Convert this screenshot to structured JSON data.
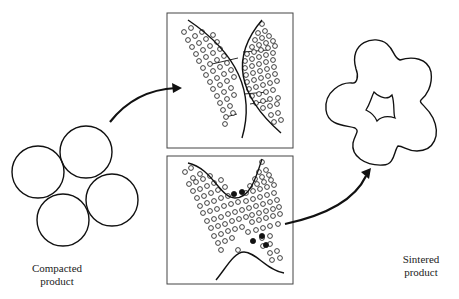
{
  "labels": {
    "compacted": "Compacted product",
    "sintered": "Sintered product"
  },
  "colors": {
    "stroke": "#111111",
    "box_border": "#444444",
    "background": "#ffffff"
  },
  "compacted_particles": [
    {
      "cx": 38,
      "cy": 172,
      "r": 26
    },
    {
      "cx": 86,
      "cy": 152,
      "r": 26
    },
    {
      "cx": 112,
      "cy": 200,
      "r": 26
    },
    {
      "cx": 63,
      "cy": 220,
      "r": 26
    }
  ],
  "panels": [
    {
      "name": "neck-formation-panel",
      "x": 167,
      "y": 13,
      "w": 126,
      "h": 135,
      "curves": [
        "M 188 20 Q 262 70 242 138",
        "M 262 20 Q 215 75 281 133"
      ],
      "open_dots": [
        [
          184,
          32
        ],
        [
          191,
          28
        ],
        [
          188,
          40
        ],
        [
          195,
          36
        ],
        [
          202,
          32
        ],
        [
          192,
          47
        ],
        [
          199,
          43
        ],
        [
          206,
          39
        ],
        [
          213,
          35
        ],
        [
          196,
          54
        ],
        [
          203,
          50
        ],
        [
          210,
          46
        ],
        [
          217,
          42
        ],
        [
          199,
          61
        ],
        [
          206,
          57
        ],
        [
          213,
          53
        ],
        [
          220,
          49
        ],
        [
          203,
          68
        ],
        [
          210,
          64
        ],
        [
          217,
          60
        ],
        [
          224,
          56
        ],
        [
          206,
          75
        ],
        [
          213,
          71
        ],
        [
          220,
          67
        ],
        [
          227,
          63
        ],
        [
          210,
          82
        ],
        [
          217,
          78
        ],
        [
          224,
          74
        ],
        [
          231,
          70
        ],
        [
          213,
          89
        ],
        [
          220,
          85
        ],
        [
          227,
          81
        ],
        [
          234,
          77
        ],
        [
          217,
          96
        ],
        [
          224,
          92
        ],
        [
          231,
          88
        ],
        [
          220,
          103
        ],
        [
          227,
          99
        ],
        [
          234,
          95
        ],
        [
          223,
          110
        ],
        [
          230,
          106
        ],
        [
          226,
          117
        ],
        [
          233,
          113
        ],
        [
          225,
          124
        ],
        [
          262,
          24
        ],
        [
          258,
          33
        ],
        [
          265,
          31
        ],
        [
          255,
          40
        ],
        [
          262,
          38
        ],
        [
          269,
          36
        ],
        [
          252,
          47
        ],
        [
          259,
          45
        ],
        [
          266,
          43
        ],
        [
          273,
          41
        ],
        [
          247,
          54
        ],
        [
          254,
          52
        ],
        [
          261,
          50
        ],
        [
          268,
          48
        ],
        [
          275,
          46
        ],
        [
          245,
          61
        ],
        [
          252,
          59
        ],
        [
          259,
          57
        ],
        [
          266,
          55
        ],
        [
          273,
          53
        ],
        [
          245,
          68
        ],
        [
          252,
          66
        ],
        [
          259,
          64
        ],
        [
          266,
          62
        ],
        [
          273,
          60
        ],
        [
          246,
          75
        ],
        [
          253,
          73
        ],
        [
          260,
          71
        ],
        [
          267,
          69
        ],
        [
          274,
          67
        ],
        [
          247,
          82
        ],
        [
          254,
          80
        ],
        [
          261,
          78
        ],
        [
          268,
          76
        ],
        [
          275,
          74
        ],
        [
          249,
          89
        ],
        [
          256,
          87
        ],
        [
          263,
          85
        ],
        [
          270,
          83
        ],
        [
          277,
          81
        ],
        [
          252,
          96
        ],
        [
          259,
          94
        ],
        [
          266,
          92
        ],
        [
          273,
          90
        ],
        [
          278,
          98
        ],
        [
          256,
          103
        ],
        [
          263,
          101
        ],
        [
          270,
          99
        ],
        [
          263,
          108
        ],
        [
          270,
          106
        ],
        [
          277,
          104
        ],
        [
          271,
          115
        ],
        [
          278,
          113
        ],
        [
          274,
          122
        ],
        [
          281,
          120
        ]
      ],
      "bonds": [
        [
          [
            243,
            52
          ],
          [
            268,
            50
          ]
        ],
        [
          [
            212,
            64
          ],
          [
            238,
            58
          ]
        ],
        [
          [
            244,
            94
          ],
          [
            268,
            92
          ]
        ],
        [
          [
            250,
            104
          ],
          [
            268,
            101
          ]
        ],
        [
          [
            226,
            117
          ],
          [
            237,
            114
          ]
        ]
      ],
      "filled_dots": []
    },
    {
      "name": "neck-growth-panel",
      "x": 167,
      "y": 156,
      "w": 126,
      "h": 128,
      "curves": [
        "M 188 163 C 212 168 220 198 235 198 C 250 198 256 178 262 159",
        "M 216 280 C 226 268 234 252 244 252 C 256 252 266 270 284 273"
      ],
      "open_dots": [
        [
          185,
          172
        ],
        [
          191,
          168
        ],
        [
          193,
          178
        ],
        [
          200,
          174
        ],
        [
          189,
          184
        ],
        [
          196,
          182
        ],
        [
          203,
          179
        ],
        [
          210,
          176
        ],
        [
          193,
          191
        ],
        [
          200,
          189
        ],
        [
          207,
          186
        ],
        [
          214,
          183
        ],
        [
          221,
          180
        ],
        [
          197,
          198
        ],
        [
          204,
          196
        ],
        [
          211,
          193
        ],
        [
          218,
          190
        ],
        [
          225,
          187
        ],
        [
          200,
          206
        ],
        [
          207,
          203
        ],
        [
          214,
          201
        ],
        [
          221,
          198
        ],
        [
          228,
          196
        ],
        [
          203,
          213
        ],
        [
          210,
          211
        ],
        [
          217,
          209
        ],
        [
          224,
          206
        ],
        [
          231,
          204
        ],
        [
          238,
          202
        ],
        [
          207,
          221
        ],
        [
          214,
          219
        ],
        [
          221,
          217
        ],
        [
          228,
          214
        ],
        [
          235,
          212
        ],
        [
          242,
          210
        ],
        [
          211,
          228
        ],
        [
          218,
          226
        ],
        [
          225,
          224
        ],
        [
          232,
          221
        ],
        [
          239,
          219
        ],
        [
          246,
          217
        ],
        [
          214,
          236
        ],
        [
          221,
          234
        ],
        [
          228,
          231
        ],
        [
          235,
          229
        ],
        [
          242,
          227
        ],
        [
          218,
          243
        ],
        [
          225,
          241
        ],
        [
          232,
          238
        ],
        [
          248,
          232
        ],
        [
          221,
          250
        ],
        [
          238,
          250
        ],
        [
          262,
          162
        ],
        [
          259,
          172
        ],
        [
          266,
          170
        ],
        [
          255,
          179
        ],
        [
          262,
          177
        ],
        [
          269,
          175
        ],
        [
          250,
          186
        ],
        [
          257,
          184
        ],
        [
          264,
          182
        ],
        [
          271,
          180
        ],
        [
          246,
          193
        ],
        [
          253,
          191
        ],
        [
          260,
          189
        ],
        [
          267,
          187
        ],
        [
          274,
          185
        ],
        [
          246,
          201
        ],
        [
          253,
          199
        ],
        [
          260,
          197
        ],
        [
          267,
          195
        ],
        [
          274,
          193
        ],
        [
          249,
          208
        ],
        [
          256,
          206
        ],
        [
          263,
          204
        ],
        [
          270,
          202
        ],
        [
          277,
          200
        ],
        [
          252,
          215
        ],
        [
          259,
          213
        ],
        [
          266,
          211
        ],
        [
          273,
          209
        ],
        [
          279,
          207
        ],
        [
          252,
          222
        ],
        [
          259,
          220
        ],
        [
          266,
          218
        ],
        [
          273,
          216
        ],
        [
          280,
          214
        ],
        [
          256,
          230
        ],
        [
          263,
          228
        ],
        [
          270,
          226
        ],
        [
          278,
          224
        ],
        [
          262,
          238
        ],
        [
          270,
          236
        ],
        [
          263,
          246
        ],
        [
          270,
          244
        ],
        [
          270,
          253
        ],
        [
          277,
          251
        ],
        [
          272,
          260
        ],
        [
          280,
          258
        ]
      ],
      "bonds": [],
      "filled_dots": [
        [
          234,
          194
        ],
        [
          242,
          192
        ],
        [
          262,
          236
        ],
        [
          266,
          245
        ],
        [
          253,
          241
        ]
      ]
    }
  ],
  "sintered": {
    "outer_path": "M 356 69 C 348 42 375 34 387 44 C 395 51 393 57 400 60 C 412 56 428 58 431 72 C 433 86 426 96 421 100 C 418 103 427 106 433 118 C 441 135 434 151 417 151 C 407 151 404 146 398 146 C 394 150 395 165 383 165 C 365 166 351 156 353 143 C 355 134 360 131 355 128 C 348 125 328 127 326 110 C 324 91 342 82 352 83 C 357 84 359 76 356 69 Z",
    "inner_path": "M 374 92 C 380 98 388 100 392 95 C 395 104 393 114 395 118 C 389 116 382 116 377 121 C 375 116 370 112 366 110 C 370 104 371 98 374 92 Z"
  },
  "arrows": [
    {
      "name": "arrow-to-neck-formation",
      "path": "M 110 122 Q 135 90 176 88",
      "head": [
        [
          182,
          88
        ],
        [
          172,
          83
        ],
        [
          173,
          93
        ]
      ]
    },
    {
      "name": "arrow-to-sintered",
      "path": "M 285 224 Q 350 210 366 176",
      "head": [
        [
          371,
          168
        ],
        [
          361,
          172
        ],
        [
          369,
          179
        ]
      ]
    }
  ]
}
